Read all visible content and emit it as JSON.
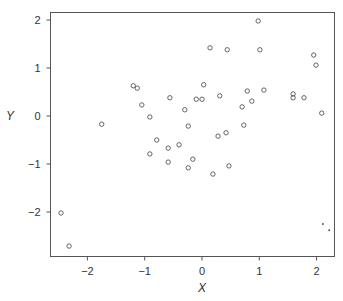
{
  "chart_data": {
    "type": "scatter",
    "title": "",
    "xlabel": "X",
    "ylabel": "Y",
    "xlim": [
      -2.65,
      2.3
    ],
    "ylim": [
      -2.9,
      2.15
    ],
    "xticks": [
      -2,
      -1,
      0,
      1,
      2
    ],
    "yticks": [
      -2,
      -1,
      0,
      1,
      2
    ],
    "xtick_labels": [
      "−2",
      "−1",
      "0",
      "1",
      "2"
    ],
    "ytick_labels": [
      "−2",
      "−1",
      "0",
      "1",
      "2"
    ],
    "grid": false,
    "legend": null,
    "series": [
      {
        "name": "observations",
        "marker": "open-circle",
        "points": [
          [
            -2.46,
            -2.02
          ],
          [
            -2.32,
            -2.71
          ],
          [
            -1.75,
            -0.17
          ],
          [
            -1.2,
            0.63
          ],
          [
            -1.13,
            0.58
          ],
          [
            -1.05,
            0.23
          ],
          [
            -0.91,
            -0.02
          ],
          [
            -0.79,
            -0.5
          ],
          [
            -0.91,
            -0.79
          ],
          [
            -0.59,
            -0.67
          ],
          [
            -0.4,
            -0.6
          ],
          [
            -0.59,
            -0.96
          ],
          [
            -0.56,
            0.38
          ],
          [
            -0.3,
            0.13
          ],
          [
            -0.24,
            -0.21
          ],
          [
            -0.24,
            -1.08
          ],
          [
            -0.16,
            -0.9
          ],
          [
            -0.1,
            0.35
          ],
          [
            0.0,
            0.35
          ],
          [
            0.03,
            0.65
          ],
          [
            0.19,
            -1.21
          ],
          [
            0.14,
            1.42
          ],
          [
            0.28,
            -0.42
          ],
          [
            0.31,
            0.42
          ],
          [
            0.42,
            -0.35
          ],
          [
            0.44,
            1.38
          ],
          [
            0.47,
            -1.04
          ],
          [
            0.7,
            0.19
          ],
          [
            0.73,
            -0.19
          ],
          [
            0.79,
            0.52
          ],
          [
            0.87,
            0.31
          ],
          [
            0.98,
            1.98
          ],
          [
            1.01,
            1.38
          ],
          [
            1.08,
            0.54
          ],
          [
            1.59,
            0.46
          ],
          [
            1.59,
            0.38
          ],
          [
            1.78,
            0.38
          ],
          [
            1.95,
            1.27
          ],
          [
            1.99,
            1.06
          ],
          [
            2.09,
            0.06
          ]
        ]
      },
      {
        "name": "highlighted",
        "marker": "small-dot",
        "points": [
          [
            2.11,
            -2.25
          ],
          [
            2.22,
            -2.38
          ]
        ]
      }
    ]
  }
}
